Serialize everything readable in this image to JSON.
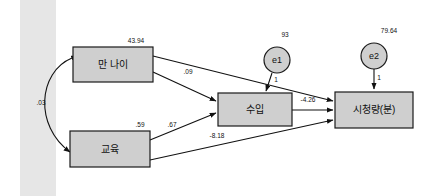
{
  "diagram": {
    "type": "sem-path-diagram",
    "background_color": "#ffffff",
    "node_fill_color": "#cfcfcf",
    "node_stroke_color": "#1a1a1a",
    "band_color": "#e6e6e6",
    "observed_variables": [
      {
        "id": "age",
        "label": "만 나이",
        "variance_label": "43.94"
      },
      {
        "id": "education",
        "label": "교육",
        "variance_label": ".59"
      },
      {
        "id": "income",
        "label": "수입",
        "variance_label": ""
      },
      {
        "id": "viewing",
        "label": "시청량(분)",
        "variance_label": ""
      }
    ],
    "error_terms": [
      {
        "id": "e1",
        "label": "e1",
        "variance_label": "93",
        "loading_label": "1"
      },
      {
        "id": "e2",
        "label": "e2",
        "variance_label": "79.64",
        "loading_label": "1"
      }
    ],
    "covariance": {
      "from": "age",
      "to": "education",
      "label": ".03",
      "style": "double-headed-curved"
    },
    "paths": [
      {
        "from": "age",
        "to": "income",
        "label": ".09"
      },
      {
        "from": "education",
        "to": "income",
        "label": ".67"
      },
      {
        "from": "income",
        "to": "viewing",
        "label": "-4.26"
      },
      {
        "from": "education",
        "to": "viewing",
        "label": "-8.18"
      },
      {
        "from": "age",
        "to": "viewing",
        "label": ""
      },
      {
        "from": "e1",
        "to": "income",
        "label": "1"
      },
      {
        "from": "e2",
        "to": "viewing",
        "label": "1"
      }
    ]
  }
}
